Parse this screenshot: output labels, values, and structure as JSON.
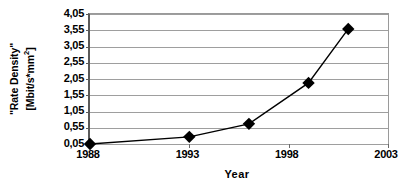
{
  "chart_data": {
    "type": "line",
    "title": "",
    "xlabel": "Year",
    "ylabel": "\"Rate Density\" [Mbit/s*mm2]",
    "ylabel_line1": "\"Rate Density\"",
    "ylabel_line2_pre": "[Mbit/s*mm",
    "ylabel_line2_sup": "2",
    "ylabel_line2_post": "]",
    "x": [
      1988,
      1993,
      1996,
      1999,
      2001
    ],
    "values": [
      0.05,
      0.27,
      0.67,
      1.93,
      3.59
    ],
    "xlim": [
      1988,
      2003
    ],
    "ylim": [
      0.05,
      4.05
    ],
    "xticks": [
      "1988",
      "1993",
      "1998",
      "2003"
    ],
    "xtick_values": [
      1988,
      1993,
      1998,
      2003
    ],
    "yticks": [
      "0,05",
      "0,55",
      "1,05",
      "1,55",
      "2,05",
      "2,55",
      "3,05",
      "3,55",
      "4,05"
    ],
    "ytick_values": [
      0.05,
      0.55,
      1.05,
      1.55,
      2.05,
      2.55,
      3.05,
      3.55,
      4.05
    ],
    "grid": true,
    "legend": false,
    "decimal_separator": ",",
    "series": [
      {
        "name": "Rate Density",
        "marker": "diamond",
        "color": "#000000",
        "line_color": "#000000",
        "points": [
          {
            "x": 1988,
            "y": 0.05
          },
          {
            "x": 1993,
            "y": 0.27
          },
          {
            "x": 1996,
            "y": 0.67
          },
          {
            "x": 1999,
            "y": 1.93
          },
          {
            "x": 2001,
            "y": 3.59
          }
        ]
      }
    ]
  }
}
